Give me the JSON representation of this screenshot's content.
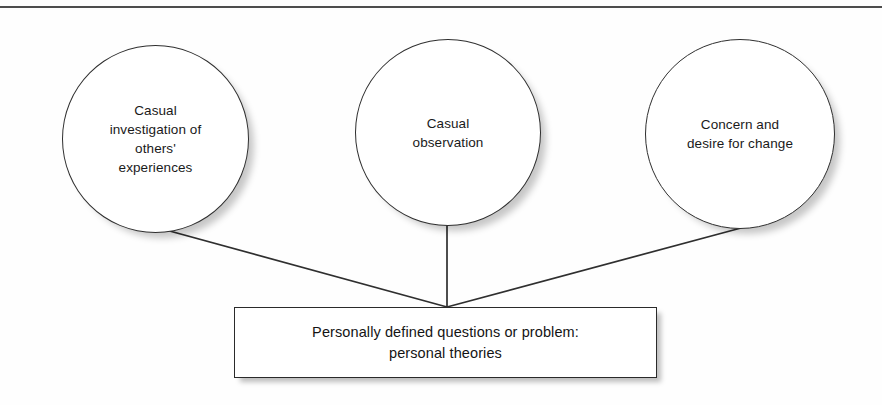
{
  "diagram": {
    "type": "convergence-flow",
    "canvas": {
      "width": 882,
      "height": 405,
      "background": "#fefefe"
    },
    "colors": {
      "stroke": "#2f2f2f",
      "rule": "#4d4d4d",
      "text": "#1a1a1a",
      "shadow": "#b5b5b5",
      "fill": "#ffffff"
    },
    "top_rule": {
      "label": "horizontal-divider",
      "y": 6,
      "thickness": 2
    },
    "nodes": [
      {
        "id": "casual-investigation",
        "shape": "circle",
        "text": "Casual\ninvestigation of\nothers'\nexperiences",
        "x": 62,
        "y": 45,
        "diameter": 187
      },
      {
        "id": "casual-observation",
        "shape": "circle",
        "text": "Casual\nobservation",
        "x": 355,
        "y": 39,
        "diameter": 186
      },
      {
        "id": "concern-desire-change",
        "shape": "circle",
        "text": "Concern and\ndesire for change",
        "x": 645,
        "y": 39,
        "diameter": 190
      },
      {
        "id": "personally-defined-questions",
        "shape": "rectangle",
        "text": "Personally defined questions or problem:\npersonal theories",
        "x": 234,
        "y": 307,
        "width": 423,
        "height": 71
      }
    ],
    "connectors": [
      {
        "id": "edge-left",
        "from": "casual-investigation",
        "to": "personally-defined-questions",
        "x1": 155,
        "y1": 227,
        "x2": 447,
        "y2": 307
      },
      {
        "id": "edge-middle",
        "from": "casual-observation",
        "to": "personally-defined-questions",
        "x1": 447,
        "y1": 225,
        "x2": 447,
        "y2": 307
      },
      {
        "id": "edge-right",
        "from": "concern-desire-change",
        "to": "personally-defined-questions",
        "x1": 741,
        "y1": 228,
        "x2": 447,
        "y2": 307
      }
    ]
  }
}
